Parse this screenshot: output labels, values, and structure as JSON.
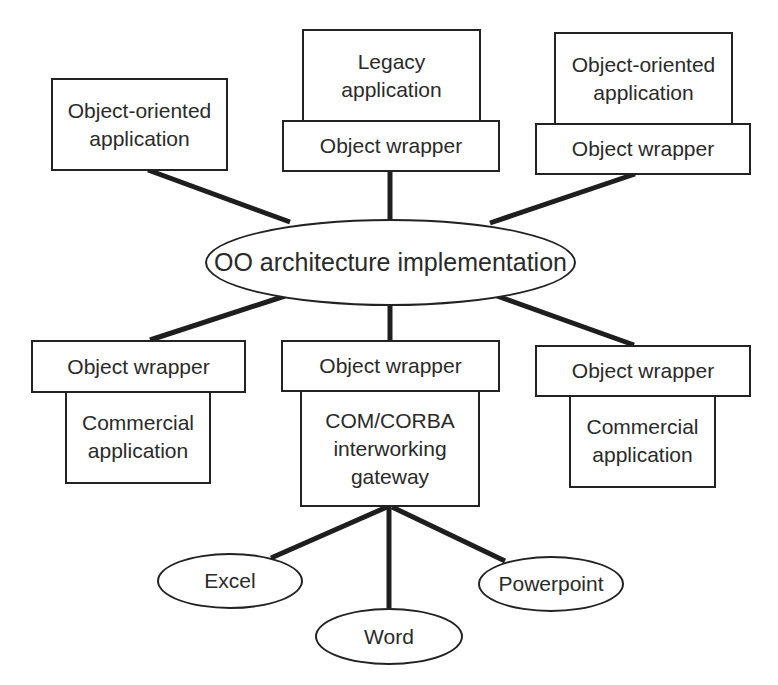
{
  "diagram": {
    "center": {
      "label": "OO architecture implementation"
    },
    "nodes": {
      "top_left_app": "Object-oriented\napplication",
      "top_center_app": "Legacy\napplication",
      "top_center_wrapper": "Object wrapper",
      "top_right_app": "Object-oriented\napplication",
      "top_right_wrapper": "Object wrapper",
      "bottom_left_wrapper": "Object wrapper",
      "bottom_left_app": "Commercial\napplication",
      "bottom_center_wrapper": "Object wrapper",
      "bottom_center_gateway": "COM/CORBA\ninterworking\ngateway",
      "bottom_right_wrapper": "Object wrapper",
      "bottom_right_app": "Commercial\napplication"
    },
    "office_apps": {
      "excel": "Excel",
      "word": "Word",
      "powerpoint": "Powerpoint"
    },
    "edges": [
      {
        "from": "top_left_app",
        "to": "center"
      },
      {
        "from": "top_center_wrapper",
        "to": "center"
      },
      {
        "from": "top_right_wrapper",
        "to": "center"
      },
      {
        "from": "center",
        "to": "bottom_left_wrapper"
      },
      {
        "from": "center",
        "to": "bottom_center_wrapper"
      },
      {
        "from": "center",
        "to": "bottom_right_wrapper"
      },
      {
        "from": "bottom_center_gateway",
        "to": "excel"
      },
      {
        "from": "bottom_center_gateway",
        "to": "word"
      },
      {
        "from": "bottom_center_gateway",
        "to": "powerpoint"
      }
    ],
    "colors": {
      "stroke": "#222222",
      "text": "#2a2a2a",
      "background": "#ffffff"
    }
  }
}
